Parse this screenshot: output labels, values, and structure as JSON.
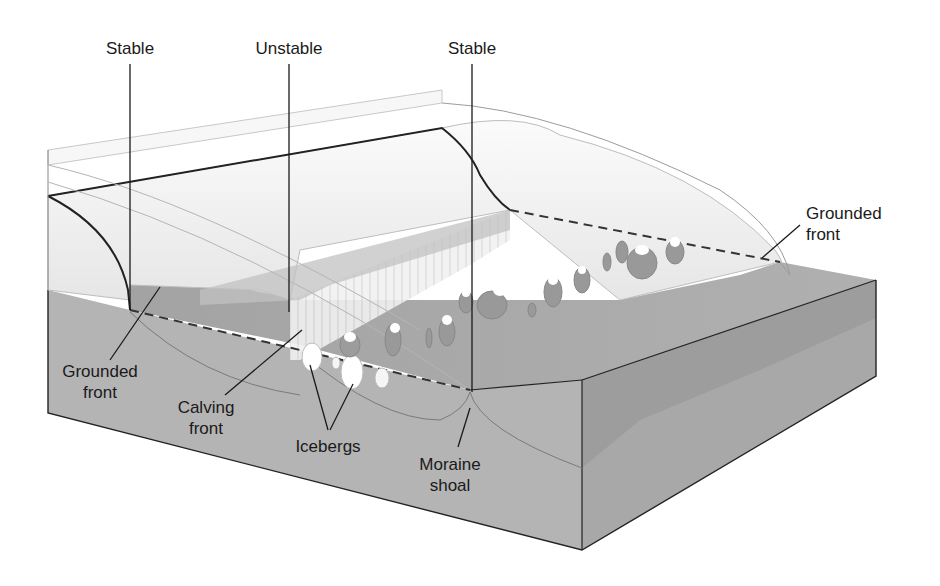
{
  "labels": {
    "stable_left": "Stable",
    "unstable": "Unstable",
    "stable_right": "Stable",
    "grounded_front_right": [
      "Grounded",
      "front"
    ],
    "grounded_front_left": [
      "Grounded",
      "front"
    ],
    "calving_front": [
      "Calving",
      "front"
    ],
    "icebergs": "Icebergs",
    "moraine_shoal": [
      "Moraine",
      "shoal"
    ]
  },
  "colors": {
    "background": "#ffffff",
    "ice": "#f4f4f4",
    "ice_shade": "#e2e2e2",
    "water": "#a9a9a9",
    "water_dark": "#989898",
    "seafloor_front": "#b4b4b4",
    "seafloor_side": "#a6a6a6",
    "outline": "#222222",
    "leader": "#1a1a1a"
  }
}
